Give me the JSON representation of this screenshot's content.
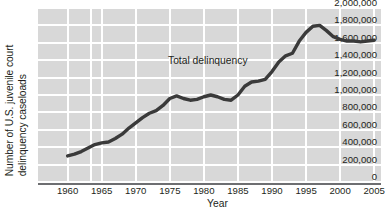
{
  "chart_data": {
    "type": "line",
    "title": "",
    "xlabel": "Year",
    "ylabel_line1": "Number of U.S. juvenile court",
    "ylabel_line2": "delinquency caseloads",
    "annotation": "Total delinquency",
    "xlim": [
      1958,
      2006
    ],
    "ylim": [
      0,
      2000000
    ],
    "grid": true,
    "legend_position": "inline-annotation",
    "xticks": [
      1960,
      1965,
      1970,
      1975,
      1980,
      1985,
      1990,
      1995,
      2000,
      2005
    ],
    "xtick_labels": [
      "1960",
      "1965",
      "1970",
      "1975",
      "1980",
      "1985",
      "1990",
      "1995",
      "2000",
      "2005"
    ],
    "yticks": [
      0,
      200000,
      400000,
      600000,
      800000,
      1000000,
      1200000,
      1400000,
      1600000,
      1800000,
      2000000
    ],
    "ytick_labels": [
      "0",
      "200,000",
      "400,000",
      "600,000",
      "800,000",
      "1,000,000",
      "1,200,000",
      "1,400,000",
      "1,600,000",
      "1,800,000",
      "2,000,000"
    ],
    "series": [
      {
        "name": "Total delinquency",
        "color": "#3a3a3a",
        "x": [
          1960,
          1961,
          1962,
          1963,
          1964,
          1965,
          1966,
          1967,
          1968,
          1969,
          1970,
          1971,
          1972,
          1973,
          1974,
          1975,
          1976,
          1977,
          1978,
          1979,
          1980,
          1981,
          1982,
          1983,
          1984,
          1985,
          1986,
          1987,
          1988,
          1989,
          1990,
          1991,
          1992,
          1993,
          1994,
          1995,
          1996,
          1997,
          1998,
          1999,
          2000,
          2001,
          2002,
          2003,
          2004,
          2005
        ],
        "values": [
          300000,
          320000,
          350000,
          390000,
          430000,
          450000,
          460000,
          500000,
          550000,
          620000,
          680000,
          740000,
          790000,
          820000,
          880000,
          960000,
          990000,
          960000,
          940000,
          950000,
          980000,
          1000000,
          980000,
          950000,
          940000,
          1000000,
          1100000,
          1150000,
          1160000,
          1180000,
          1270000,
          1380000,
          1450000,
          1480000,
          1620000,
          1720000,
          1790000,
          1800000,
          1740000,
          1670000,
          1640000,
          1620000,
          1620000,
          1610000,
          1620000,
          1630000
        ]
      }
    ]
  },
  "colors": {
    "plot_background": "#d8d8d8",
    "gridline": "#ffffff",
    "axis_line": "#6d6e71",
    "series_line": "#3a3a3a",
    "text": "#231f20"
  }
}
